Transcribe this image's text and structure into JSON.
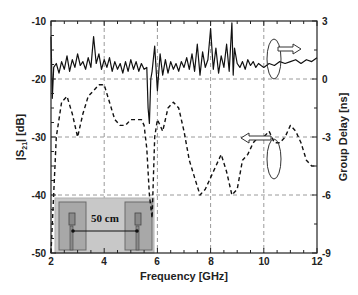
{
  "chart_data": {
    "type": "line",
    "title": "",
    "xlabel": "Frequency [GHz]",
    "ylabel_left": "|S21| [dB]",
    "ylabel_right": "Group Delay [ns]",
    "xlim": [
      2,
      12
    ],
    "ylim_left": [
      -50,
      -10
    ],
    "ylim_right": [
      -9,
      3
    ],
    "x_ticks": [
      2,
      4,
      6,
      8,
      10,
      12
    ],
    "y_ticks_left": [
      -10,
      -20,
      -30,
      -40,
      -50
    ],
    "y_ticks_right": [
      3,
      0,
      -3,
      -6,
      -9
    ],
    "grid": true,
    "series": [
      {
        "name": "Group Delay",
        "axis": "right",
        "style": "solid",
        "x": [
          2.0,
          2.05,
          2.1,
          2.2,
          2.3,
          2.4,
          2.5,
          2.6,
          2.7,
          2.8,
          2.9,
          3.0,
          3.1,
          3.2,
          3.3,
          3.4,
          3.5,
          3.6,
          3.7,
          3.8,
          3.9,
          4.0,
          4.1,
          4.2,
          4.3,
          4.4,
          4.5,
          4.6,
          4.7,
          4.8,
          4.9,
          5.0,
          5.1,
          5.2,
          5.3,
          5.4,
          5.5,
          5.6,
          5.65,
          5.7,
          5.75,
          5.8,
          5.9,
          6.0,
          6.1,
          6.2,
          6.3,
          6.4,
          6.5,
          6.6,
          6.7,
          6.8,
          6.9,
          7.0,
          7.1,
          7.2,
          7.3,
          7.4,
          7.5,
          7.6,
          7.7,
          7.8,
          7.9,
          8.0,
          8.1,
          8.2,
          8.3,
          8.4,
          8.5,
          8.6,
          8.7,
          8.8,
          8.85,
          8.9,
          9.0,
          9.1,
          9.2,
          9.3,
          9.4,
          9.5,
          9.6,
          9.7,
          9.8,
          9.9,
          10.0,
          10.2,
          10.4,
          10.6,
          10.8,
          11.0,
          11.2,
          11.4,
          11.6,
          11.8,
          12.0
        ],
        "values": [
          2.2,
          -1.0,
          0.6,
          0.8,
          0.3,
          0.9,
          0.5,
          1.2,
          0.4,
          1.0,
          0.6,
          1.3,
          0.7,
          0.9,
          0.5,
          1.1,
          0.6,
          2.2,
          0.8,
          1.3,
          0.5,
          1.0,
          0.6,
          1.1,
          0.4,
          0.9,
          0.5,
          0.8,
          0.3,
          0.9,
          0.4,
          1.0,
          0.5,
          0.9,
          0.4,
          0.8,
          0.5,
          0.6,
          -1.5,
          -2.3,
          0.0,
          0.4,
          1.7,
          -0.6,
          1.3,
          0.2,
          1.0,
          0.3,
          0.9,
          0.5,
          0.8,
          0.4,
          0.9,
          0.6,
          1.1,
          0.5,
          1.3,
          0.4,
          1.8,
          0.2,
          1.4,
          0.6,
          1.0,
          2.6,
          0.5,
          1.6,
          0.3,
          1.2,
          0.6,
          1.8,
          0.4,
          2.9,
          0.2,
          1.6,
          0.8,
          0.6,
          0.9,
          0.5,
          1.0,
          0.7,
          0.9,
          0.6,
          0.8,
          0.7,
          0.6,
          0.8,
          0.7,
          0.9,
          0.8,
          0.9,
          1.0,
          0.8,
          1.0,
          0.9,
          1.1
        ]
      },
      {
        "name": "|S21|",
        "axis": "left",
        "style": "dashed",
        "x": [
          2.0,
          2.2,
          2.4,
          2.6,
          2.8,
          3.0,
          3.2,
          3.4,
          3.6,
          3.8,
          4.0,
          4.2,
          4.4,
          4.6,
          4.8,
          5.0,
          5.2,
          5.4,
          5.5,
          5.6,
          5.7,
          5.8,
          5.9,
          6.0,
          6.2,
          6.4,
          6.6,
          6.8,
          7.0,
          7.2,
          7.4,
          7.6,
          7.8,
          8.0,
          8.2,
          8.4,
          8.6,
          8.8,
          9.0,
          9.2,
          9.4,
          9.6,
          9.8,
          10.0,
          10.2,
          10.4,
          10.6,
          10.8,
          11.0,
          11.2,
          11.4,
          11.6,
          11.8,
          12.0
        ],
        "values": [
          -50,
          -30,
          -24,
          -23,
          -26,
          -30,
          -26,
          -23,
          -22,
          -21,
          -21,
          -24,
          -27,
          -28,
          -28,
          -27,
          -27,
          -27,
          -28,
          -32,
          -40,
          -44,
          -30,
          -27,
          -29,
          -25,
          -24,
          -25,
          -29,
          -34,
          -37,
          -40,
          -39,
          -37,
          -35,
          -33,
          -36,
          -40,
          -39,
          -34,
          -33,
          -31,
          -30,
          -30,
          -29,
          -31,
          -31,
          -30,
          -28,
          -29,
          -31,
          -34,
          -35,
          -35
        ]
      }
    ],
    "annotations": [
      {
        "type": "ellipse-with-arrow",
        "target": "Group Delay",
        "direction": "right",
        "x": 10.6,
        "y_left": -18
      },
      {
        "type": "ellipse-with-arrow",
        "target": "|S21|",
        "direction": "left",
        "x": 10.6,
        "y_left": -33
      },
      {
        "type": "inset",
        "label": "50 cm",
        "position": "bottom-left"
      }
    ]
  },
  "axes": {
    "x_title": "Frequency [GHz]",
    "y_left_title_main": "|S",
    "y_left_title_sub": "21",
    "y_left_title_tail": "| [dB]",
    "y_right_title": "Group Delay [ns]",
    "x_ticks": [
      "2",
      "4",
      "6",
      "8",
      "10",
      "12"
    ],
    "y_left_ticks": [
      "-10",
      "-20",
      "-30",
      "-40",
      "-50"
    ],
    "y_right_ticks": [
      "3",
      "0",
      "-3",
      "-6",
      "-9"
    ]
  },
  "inset": {
    "distance_label": "50 cm"
  },
  "colors": {
    "line": "#111111",
    "grid": "#9a9a9a",
    "inset_bg": "#c8c8c8",
    "antenna_box": "#a8a8a8",
    "antenna_element": "#8a8a8a"
  }
}
